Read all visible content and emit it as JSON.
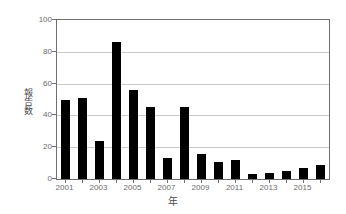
{
  "chart_data": {
    "type": "bar",
    "title": "",
    "xlabel": "年",
    "ylabel": "報告数",
    "categories": [
      "2001",
      "2002",
      "2003",
      "2004",
      "2005",
      "2006",
      "2007",
      "2008",
      "2009",
      "2010",
      "2011",
      "2012",
      "2013",
      "2014",
      "2015",
      "2016"
    ],
    "values": [
      50,
      51,
      24,
      86,
      56,
      45,
      13,
      45,
      16,
      11,
      12,
      3,
      4,
      5,
      7,
      9
    ],
    "series": [
      {
        "name": "報告数",
        "values": [
          50,
          51,
          24,
          86,
          56,
          45,
          13,
          45,
          16,
          11,
          12,
          3,
          4,
          5,
          7,
          9
        ]
      }
    ],
    "ylim": [
      0,
      100
    ],
    "yticks": [
      0,
      20,
      40,
      60,
      80,
      100
    ],
    "ytick_labels": [
      "0",
      "20",
      "40",
      "60",
      "80",
      "100"
    ],
    "xtick_labels": [
      "2001",
      "2003",
      "2005",
      "2007",
      "2009",
      "2011",
      "2013",
      "2015"
    ],
    "grid": "horizontal",
    "legend": "none",
    "bar_color": "#000000",
    "gridline_color": "#c9c9c9",
    "axis_color": "#6f6f6f",
    "background_color": "#ffffff"
  }
}
